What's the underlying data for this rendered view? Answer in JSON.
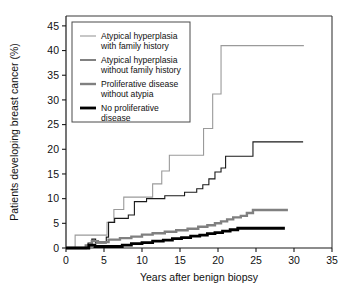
{
  "chart_data": {
    "type": "line",
    "title": "",
    "xlabel": "Years after benign biopsy",
    "ylabel": "Patients developing breast cancer (%)",
    "xlim": [
      0,
      35
    ],
    "ylim": [
      0,
      47
    ],
    "xticks": [
      0,
      5,
      10,
      15,
      20,
      25,
      30,
      35
    ],
    "yticks": [
      0,
      5,
      10,
      15,
      20,
      25,
      30,
      35,
      40,
      45
    ],
    "grid": false,
    "legend_position": "top-left",
    "step_type": "post",
    "series": [
      {
        "name": "Atypical hyperplasia with family history",
        "label_line1": "Atypical hyperplasia",
        "label_line2": "with family history",
        "color": "#9a9a9a",
        "width": 1.1,
        "final_value": 41,
        "points": [
          [
            0,
            0
          ],
          [
            1.2,
            0
          ],
          [
            1.2,
            2.6
          ],
          [
            5.4,
            2.6
          ],
          [
            5.4,
            5.2
          ],
          [
            6.3,
            5.2
          ],
          [
            6.3,
            7.8
          ],
          [
            7.6,
            7.8
          ],
          [
            7.6,
            10.3
          ],
          [
            11.4,
            10.3
          ],
          [
            11.4,
            13.0
          ],
          [
            12.6,
            13.0
          ],
          [
            12.6,
            15.6
          ],
          [
            13.6,
            15.6
          ],
          [
            13.6,
            18.8
          ],
          [
            18.1,
            18.8
          ],
          [
            18.1,
            24.2
          ],
          [
            19.3,
            24.2
          ],
          [
            19.3,
            31.2
          ],
          [
            20.4,
            31.2
          ],
          [
            20.4,
            41.0
          ],
          [
            31.3,
            41.0
          ]
        ]
      },
      {
        "name": "Atypical hyperplasia without family history",
        "label_line1": "Atypical hyperplasia",
        "label_line2": "without family history",
        "color": "#1a1a1a",
        "width": 1.1,
        "final_value": 21.5,
        "points": [
          [
            0,
            0
          ],
          [
            2.9,
            0
          ],
          [
            2.9,
            1.0
          ],
          [
            3.4,
            1.0
          ],
          [
            3.4,
            1.8
          ],
          [
            3.9,
            1.8
          ],
          [
            3.9,
            1.0
          ],
          [
            5.3,
            1.0
          ],
          [
            5.3,
            2.2
          ],
          [
            5.6,
            2.2
          ],
          [
            5.6,
            5.2
          ],
          [
            6.4,
            5.2
          ],
          [
            6.4,
            6.0
          ],
          [
            8.2,
            6.0
          ],
          [
            8.2,
            6.7
          ],
          [
            9.0,
            6.7
          ],
          [
            9.0,
            9.4
          ],
          [
            10.6,
            9.4
          ],
          [
            10.6,
            10.0
          ],
          [
            13.0,
            10.0
          ],
          [
            13.0,
            10.6
          ],
          [
            15.6,
            10.6
          ],
          [
            15.6,
            11.3
          ],
          [
            17.2,
            11.3
          ],
          [
            17.2,
            12.0
          ],
          [
            18.0,
            12.0
          ],
          [
            18.0,
            12.8
          ],
          [
            18.8,
            12.8
          ],
          [
            18.8,
            14.0
          ],
          [
            19.6,
            14.0
          ],
          [
            19.6,
            15.4
          ],
          [
            20.4,
            15.4
          ],
          [
            20.4,
            16.2
          ],
          [
            21.0,
            16.2
          ],
          [
            21.0,
            18.6
          ],
          [
            24.6,
            18.6
          ],
          [
            24.6,
            21.5
          ],
          [
            31.2,
            21.5
          ]
        ]
      },
      {
        "name": "Proliferative disease without atypia",
        "label_line1": "Proliferative disease",
        "label_line2": "without atypia",
        "color": "#808080",
        "width": 2.4,
        "final_value": 7.7,
        "points": [
          [
            0,
            0
          ],
          [
            2.6,
            0
          ],
          [
            2.6,
            0.5
          ],
          [
            3.4,
            0.5
          ],
          [
            3.4,
            1.4
          ],
          [
            4.2,
            1.4
          ],
          [
            4.2,
            1.2
          ],
          [
            5.6,
            1.2
          ],
          [
            5.6,
            1.7
          ],
          [
            7.1,
            1.7
          ],
          [
            7.1,
            2.0
          ],
          [
            8.6,
            2.0
          ],
          [
            8.6,
            2.3
          ],
          [
            10.0,
            2.3
          ],
          [
            10.0,
            2.7
          ],
          [
            11.4,
            2.7
          ],
          [
            11.4,
            3.0
          ],
          [
            13.0,
            3.0
          ],
          [
            13.0,
            3.3
          ],
          [
            14.5,
            3.3
          ],
          [
            14.5,
            3.6
          ],
          [
            16.0,
            3.6
          ],
          [
            16.0,
            3.9
          ],
          [
            17.4,
            3.9
          ],
          [
            17.4,
            4.3
          ],
          [
            18.6,
            4.3
          ],
          [
            18.6,
            4.6
          ],
          [
            19.6,
            4.6
          ],
          [
            19.6,
            5.0
          ],
          [
            20.4,
            5.0
          ],
          [
            20.4,
            5.4
          ],
          [
            21.2,
            5.4
          ],
          [
            21.2,
            5.8
          ],
          [
            22.0,
            5.8
          ],
          [
            22.0,
            6.2
          ],
          [
            23.0,
            6.2
          ],
          [
            23.0,
            6.5
          ],
          [
            23.8,
            6.5
          ],
          [
            23.8,
            7.1
          ],
          [
            24.6,
            7.1
          ],
          [
            24.6,
            7.7
          ],
          [
            29.2,
            7.7
          ]
        ]
      },
      {
        "name": "No proliferative disease",
        "label_line1": "No proliferative",
        "label_line2": "disease",
        "color": "#000000",
        "width": 2.8,
        "final_value": 4.0,
        "points": [
          [
            0,
            0
          ],
          [
            3.0,
            0
          ],
          [
            3.0,
            0.6
          ],
          [
            3.8,
            0.6
          ],
          [
            3.8,
            0.3
          ],
          [
            7.4,
            0.3
          ],
          [
            7.4,
            0.6
          ],
          [
            8.6,
            0.6
          ],
          [
            8.6,
            0.9
          ],
          [
            10.0,
            0.9
          ],
          [
            10.0,
            1.1
          ],
          [
            11.4,
            1.1
          ],
          [
            11.4,
            1.4
          ],
          [
            12.8,
            1.4
          ],
          [
            12.8,
            1.6
          ],
          [
            14.0,
            1.6
          ],
          [
            14.0,
            1.9
          ],
          [
            15.2,
            1.9
          ],
          [
            15.2,
            2.1
          ],
          [
            16.4,
            2.1
          ],
          [
            16.4,
            2.4
          ],
          [
            17.6,
            2.4
          ],
          [
            17.6,
            2.6
          ],
          [
            18.6,
            2.6
          ],
          [
            18.6,
            2.9
          ],
          [
            19.6,
            2.9
          ],
          [
            19.6,
            3.1
          ],
          [
            20.6,
            3.1
          ],
          [
            20.6,
            3.4
          ],
          [
            21.6,
            3.4
          ],
          [
            21.6,
            3.7
          ],
          [
            22.6,
            3.7
          ],
          [
            22.6,
            4.0
          ],
          [
            28.8,
            4.0
          ]
        ]
      }
    ]
  }
}
